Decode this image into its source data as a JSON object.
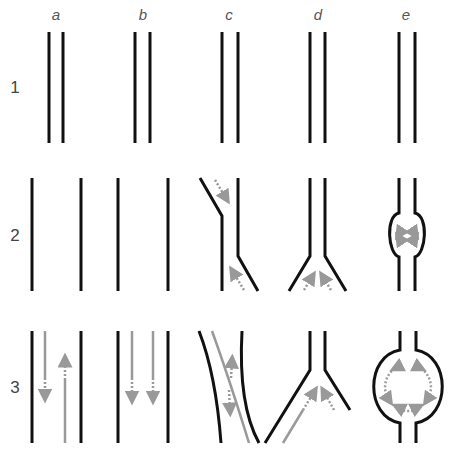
{
  "figure": {
    "columns": [
      {
        "key": "a",
        "label": "a"
      },
      {
        "key": "b",
        "label": "b"
      },
      {
        "key": "c",
        "label": "c"
      },
      {
        "key": "d",
        "label": "d"
      },
      {
        "key": "e",
        "label": "e"
      }
    ],
    "rows": [
      {
        "key": "1",
        "label": "1",
        "description": "Stage 1: paired parallel channel walls in all columns"
      },
      {
        "key": "2",
        "label": "2",
        "description": "Stage 2: walls separate, bend into angled offsets, split into a Y, or bulge into a round chamber with small circulating arrows"
      },
      {
        "key": "3",
        "label": "3",
        "description": "Stage 3: grey flow arrows develop — opposing flows (a), parallel flows (b), bidirectional along a curved channel (c), converging flows into a Y (d), circular flow in enlarged chamber (e)"
      }
    ],
    "colors": {
      "wall": "#111111",
      "flow_arrow": "#999999",
      "label_text": "#555555",
      "background": "#ffffff"
    },
    "panels": {
      "1a": "two close parallel vertical lines",
      "1b": "two close parallel vertical lines",
      "1c": "two close parallel vertical lines",
      "1d": "two close parallel vertical lines",
      "1e": "two close parallel vertical lines",
      "2a": "two widely separated vertical lines",
      "2b": "two widely separated vertical lines",
      "2c": "two offset lines with angled segments; dashed arrows pointing into the bends",
      "2d": "Y-shaped split with two converging dashed arrows",
      "2e": "channel widening into a circle with four small arrows",
      "3a": "wide channel with one downward arrow and one upward arrow",
      "3b": "wide channel with two downward arrows",
      "3c": "curved diagonal channel with grey flow line and double-headed arrow",
      "3d": "wide Y split with two grey arrows converging toward the stem",
      "3e": "large round chamber with dashed circular flow arrows"
    }
  }
}
